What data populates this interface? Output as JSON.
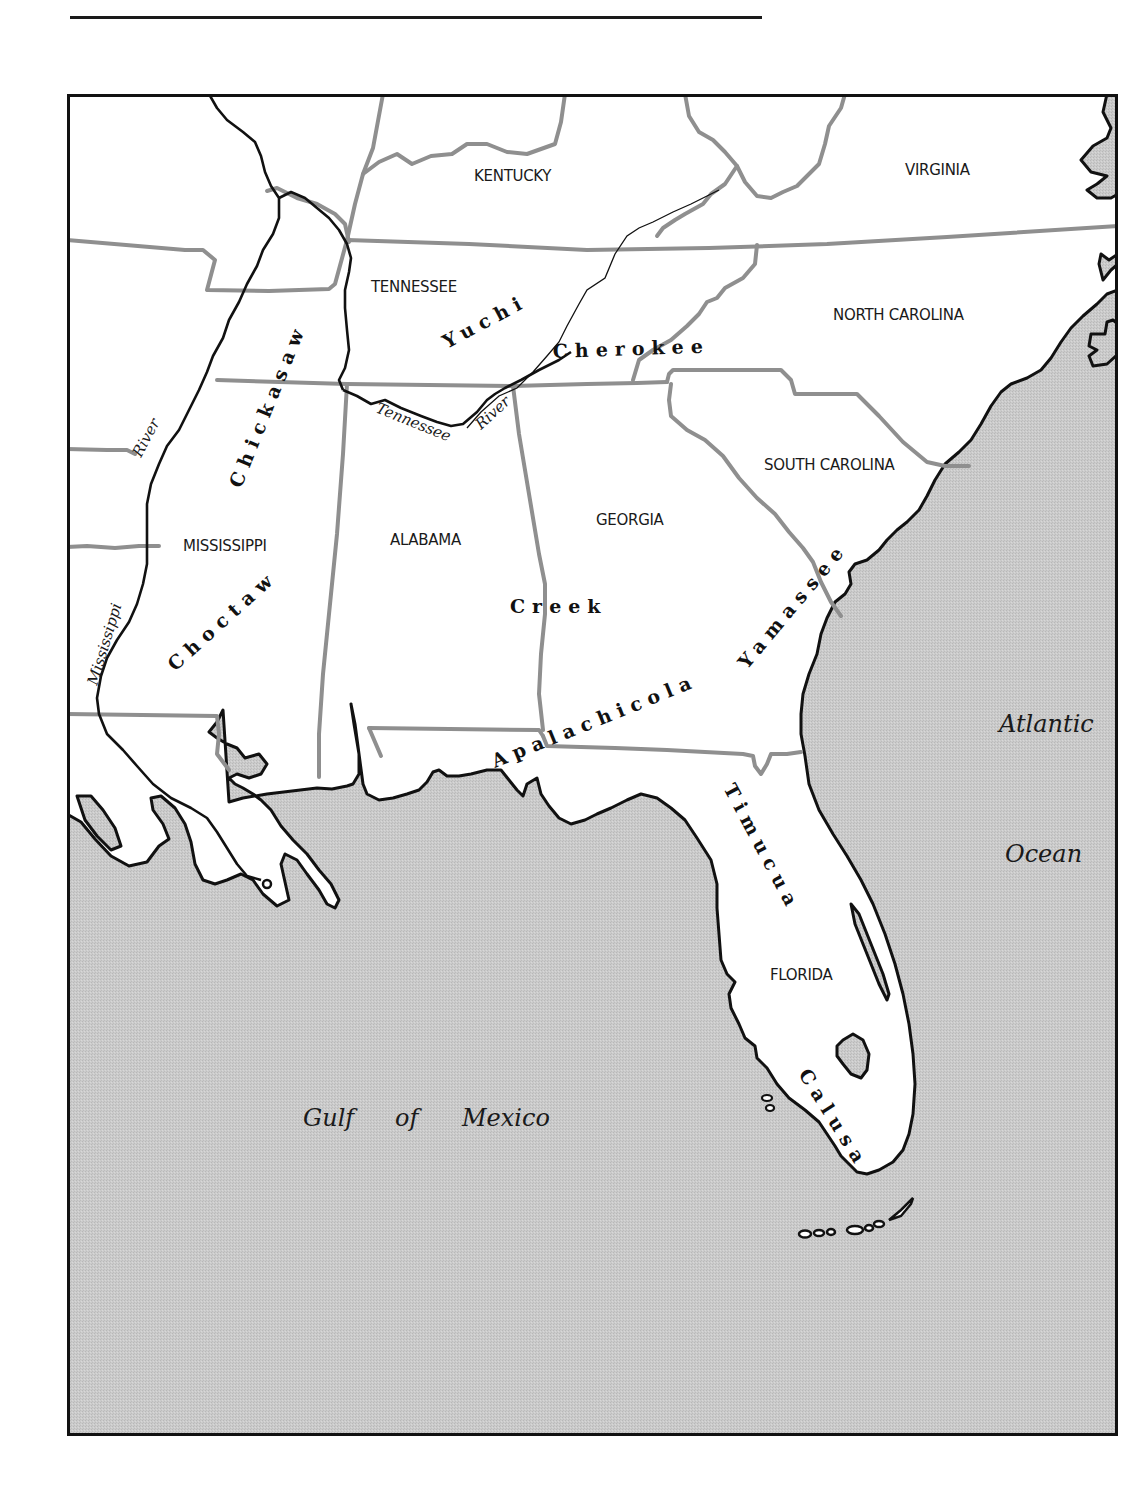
{
  "map": {
    "colors": {
      "water": "#c8c8c8",
      "land": "#ffffff",
      "state_border": "#8f8f8f",
      "coast": "#111111",
      "frame": "#111111"
    },
    "states": [
      {
        "name": "KENTUCKY",
        "x": 452,
        "y": 87
      },
      {
        "name": "VIRGINIA",
        "x": 838,
        "y": 81
      },
      {
        "name": "TENNESSEE",
        "x": 304,
        "y": 199
      },
      {
        "name": "NORTH CAROLINA",
        "x": 766,
        "y": 226
      },
      {
        "name": "SOUTH CAROLINA",
        "x": 697,
        "y": 376
      },
      {
        "name": "MISSISSIPPI",
        "x": 116,
        "y": 457
      },
      {
        "name": "ALABAMA",
        "x": 323,
        "y": 452
      },
      {
        "name": "GEORGIA",
        "x": 529,
        "y": 432
      },
      {
        "name": "FLORIDA",
        "x": 703,
        "y": 886
      }
    ],
    "tribes": [
      {
        "name": "Yuchi",
        "x": 378,
        "y": 255,
        "rotate": -28
      },
      {
        "name": "Cherokee",
        "x": 485,
        "y": 263,
        "rotate": -2
      },
      {
        "name": "Chickasaw",
        "x": 171,
        "y": 395,
        "rotate": -68
      },
      {
        "name": "Choctaw",
        "x": 107,
        "y": 578,
        "rotate": -42
      },
      {
        "name": "Creek",
        "x": 443,
        "y": 519,
        "rotate": 0
      },
      {
        "name": "Yamassee",
        "x": 680,
        "y": 580,
        "rotate": -50
      },
      {
        "name": "Apalachicola",
        "x": 428,
        "y": 675,
        "rotate": -22
      },
      {
        "name": "Timucua",
        "x": 658,
        "y": 695,
        "rotate": 62
      },
      {
        "name": "Calusa",
        "x": 731,
        "y": 980,
        "rotate": 58
      }
    ],
    "water_bodies": [
      {
        "name": "Atlantic",
        "x": 932,
        "y": 638
      },
      {
        "name": "Ocean",
        "x": 938,
        "y": 768
      },
      {
        "name": "Gulf",
        "x": 236,
        "y": 1032
      },
      {
        "name": "of",
        "x": 328,
        "y": 1032
      },
      {
        "name": "Mexico",
        "x": 395,
        "y": 1032
      }
    ],
    "rivers": [
      {
        "name": "Mississippi",
        "x": 28,
        "y": 590,
        "rotate": -73
      },
      {
        "name": "River",
        "x": 72,
        "y": 363,
        "rotate": -62
      },
      {
        "name": "Tennessee",
        "x": 308,
        "y": 318,
        "rotate": 22
      },
      {
        "name": "River",
        "x": 414,
        "y": 334,
        "rotate": -42
      }
    ]
  }
}
